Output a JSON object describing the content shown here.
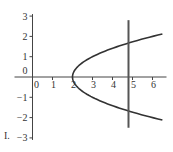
{
  "chart_data": {
    "type": "line",
    "title": "",
    "xlabel": "",
    "ylabel": "",
    "xlim": [
      -0.9,
      6.7
    ],
    "ylim": [
      -3.1,
      3.1
    ],
    "grid": false,
    "x_ticks": [
      0,
      1,
      2,
      3,
      4,
      5,
      6
    ],
    "x_tick_labels": [
      "0",
      "1",
      "2",
      "3",
      "4",
      "5",
      "6"
    ],
    "y_ticks": [
      3,
      2,
      1,
      0,
      -1,
      -2,
      -3
    ],
    "y_tick_labels": [
      "3",
      "2",
      "1",
      "0",
      "−1",
      "−2",
      "−3"
    ],
    "series": [
      {
        "name": "parabola",
        "equation": "x = y^2 + 2",
        "vertex": [
          2,
          0
        ],
        "y_range": [
          -2.12,
          2.12
        ],
        "color": "#333333"
      },
      {
        "name": "vertical-line",
        "equation": "x = 4.8",
        "x": 4.8,
        "y_range": [
          -2.5,
          2.8
        ],
        "color": "#555555"
      }
    ],
    "annotations": [
      "I."
    ]
  },
  "label": "I."
}
